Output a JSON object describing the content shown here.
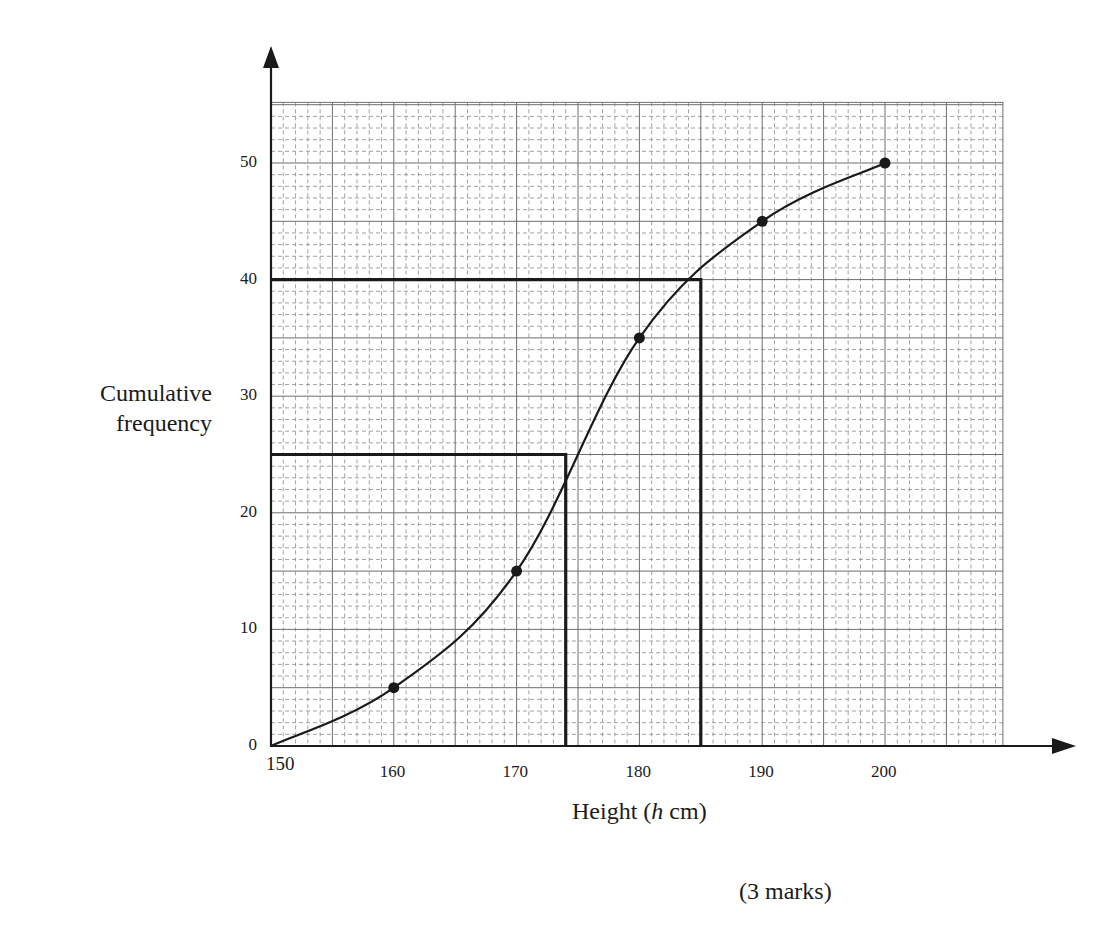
{
  "chart_data": {
    "type": "line",
    "title": "",
    "xlabel": "Height (h cm)",
    "xlabel_parts": {
      "pre": "Height (",
      "italic": "h",
      "post": " cm)"
    },
    "ylabel": "Cumulative frequency",
    "ylabel_lines": [
      "Cumulative",
      "frequency"
    ],
    "x_tick_labels": [
      "150",
      "160",
      "170",
      "180",
      "190",
      "200"
    ],
    "x_ticks": [
      150,
      160,
      170,
      180,
      190,
      200
    ],
    "y_tick_labels": [
      "0",
      "10",
      "20",
      "30",
      "40",
      "50"
    ],
    "y_ticks": [
      0,
      10,
      20,
      30,
      40,
      50
    ],
    "xlim": [
      150,
      209.6
    ],
    "ylim": [
      0,
      55.2
    ],
    "grid": {
      "major_x_step": 5,
      "major_y_step": 5,
      "minor_step": 1,
      "minor_style": "dashed"
    },
    "series": [
      {
        "name": "Cumulative frequency curve",
        "x": [
          150,
          160,
          170,
          180,
          190,
          200
        ],
        "values": [
          0,
          5,
          15,
          35,
          45,
          50
        ],
        "markers": [
          false,
          true,
          true,
          true,
          true,
          true
        ]
      }
    ],
    "reading_lines": [
      {
        "y": 40,
        "x": 185,
        "label": "upper quartile reading"
      },
      {
        "y": 25,
        "x": 174,
        "label": "median reading"
      }
    ],
    "legend": null
  },
  "footer": {
    "marks": "(3 marks)"
  },
  "colors": {
    "ink": "#1a1a1a",
    "grid_major": "#6e6e6e",
    "grid_minor": "#8a8a8a",
    "background": "#ffffff"
  }
}
